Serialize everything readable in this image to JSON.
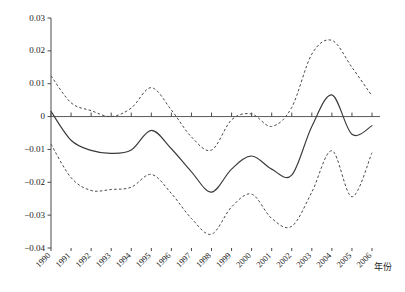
{
  "chart_data": {
    "type": "line",
    "title": "",
    "subtitle": "",
    "xlabel": "年份",
    "ylabel": "",
    "xlim": [
      1990,
      2006
    ],
    "ylim": [
      -0.04,
      0.03
    ],
    "grid": false,
    "legend": null,
    "x": [
      1990,
      1991,
      1992,
      1993,
      1994,
      1995,
      1996,
      1997,
      1998,
      1999,
      2000,
      2001,
      2002,
      2003,
      2004,
      2005,
      2006
    ],
    "x_tick_labels": [
      "1990",
      "1991",
      "1992",
      "1993",
      "1994",
      "1995",
      "1996",
      "1997",
      "1998",
      "1999",
      "2000",
      "2001",
      "2002",
      "2003",
      "2004",
      "2005",
      "2006"
    ],
    "y_tick_labels": [
      "0.03",
      "0.02",
      "0.01",
      "0",
      "−0.01",
      "−0.02",
      "−0.03",
      "−0.04"
    ],
    "y_ticks": [
      0.03,
      0.02,
      0.01,
      0,
      -0.01,
      -0.02,
      -0.03,
      -0.04
    ],
    "zero_line": 0,
    "series": [
      {
        "name": "estimate",
        "style": "solid",
        "color": "#3a3a3a",
        "values": [
          0.0016,
          -0.0072,
          -0.0103,
          -0.0112,
          -0.0102,
          -0.0042,
          -0.0098,
          -0.0168,
          -0.023,
          -0.016,
          -0.012,
          -0.016,
          -0.0178,
          -0.003,
          0.0066,
          -0.0054,
          -0.0028
        ]
      },
      {
        "name": "upper-confidence-bound",
        "style": "dashed",
        "color": "#4a4a4a",
        "values": [
          0.0124,
          0.0042,
          0.0018,
          0.0,
          0.0026,
          0.0088,
          0.002,
          -0.0062,
          -0.0102,
          -0.001,
          0.0008,
          -0.003,
          0.0028,
          0.019,
          0.0232,
          0.015,
          0.0063
        ]
      },
      {
        "name": "lower-confidence-bound",
        "style": "dashed",
        "color": "#4a4a4a",
        "values": [
          -0.0084,
          -0.0186,
          -0.0225,
          -0.0222,
          -0.0215,
          -0.0176,
          -0.0234,
          -0.031,
          -0.0358,
          -0.0275,
          -0.0236,
          -0.031,
          -0.0334,
          -0.023,
          -0.0104,
          -0.0244,
          -0.011
        ]
      }
    ]
  },
  "axis": {
    "x_axis_title": "年份"
  }
}
